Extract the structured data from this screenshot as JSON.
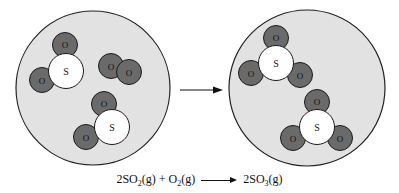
{
  "diagram": {
    "colors": {
      "container_fill": "#e2e2e2",
      "container_stroke": "#222222",
      "oxygen_fill": "#6a6a6a",
      "sulfur_fill": "#ffffff",
      "atom_stroke": "#1a1a1a",
      "arrow": "#111111"
    },
    "atom_labels": {
      "oxygen": "O",
      "sulfur": "S"
    },
    "reactants_container": {
      "label": "Before",
      "molecules": [
        {
          "formula": "SO2",
          "atoms": [
            "S",
            "O",
            "O"
          ]
        },
        {
          "formula": "O2",
          "atoms": [
            "O",
            "O"
          ]
        },
        {
          "formula": "SO2",
          "atoms": [
            "S",
            "O",
            "O"
          ]
        }
      ]
    },
    "products_container": {
      "label": "After",
      "molecules": [
        {
          "formula": "SO3",
          "atoms": [
            "S",
            "O",
            "O",
            "O"
          ]
        },
        {
          "formula": "SO3",
          "atoms": [
            "S",
            "O",
            "O",
            "O"
          ]
        }
      ]
    },
    "arrow": "right-arrow"
  },
  "equation": {
    "coef1": "2",
    "r1_base": "SO",
    "r1_sub": "2",
    "r1_state": "(g)",
    "plus": " + ",
    "r2_base": "O",
    "r2_sub": "2",
    "r2_state": "(g)",
    "coef3": "2",
    "p1_base": "SO",
    "p1_sub": "3",
    "p1_state": "(g)"
  }
}
